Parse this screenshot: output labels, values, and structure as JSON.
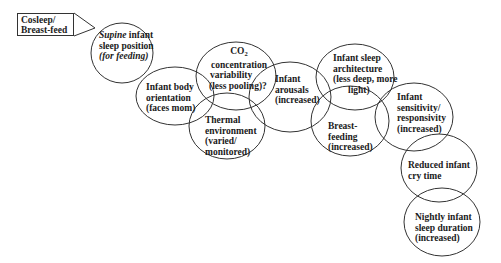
{
  "diagram": {
    "callout": {
      "line1": "Cosleep/",
      "line2": "Breast-feed"
    },
    "nodes": [
      {
        "id": "supine",
        "line1_italic": "Supine",
        "line1_rest": " infant",
        "line2": "sleep position",
        "line3_italic": "(for feeding)"
      },
      {
        "id": "body-orientation",
        "line1": "Infant body",
        "line2": "orientation",
        "line3": "(faces mom)"
      },
      {
        "id": "co2",
        "line1_main": "CO",
        "line1_sub": "2",
        "line2": "concentration",
        "line3": "variability",
        "line4": "(less pooling)?"
      },
      {
        "id": "thermal",
        "line1": "Thermal",
        "line2": "environment",
        "line3": "(varied/",
        "line4": "monitored)"
      },
      {
        "id": "arousals",
        "line1": "Infant",
        "line2": "arousals",
        "line3": "(increased)"
      },
      {
        "id": "sleep-architecture",
        "line1": "Infant sleep",
        "line2": "architecture",
        "line3": "(less deep, more",
        "line4": "light)"
      },
      {
        "id": "breast-feeding",
        "line1": "Breast-",
        "line2": "feeding",
        "line3": "(increased)"
      },
      {
        "id": "sensitivity",
        "line1": "Infant",
        "line2": "sensitivity/",
        "line3": "responsivity",
        "line4": "(increased)"
      },
      {
        "id": "cry-time",
        "line1": "Reduced infant",
        "line2": "cry time"
      },
      {
        "id": "sleep-duration",
        "line1": "Nightly infant",
        "line2": "sleep duration",
        "line3": "(increased)"
      }
    ],
    "colors": {
      "stroke": "#333333",
      "text": "#1a1a1a",
      "background": "#ffffff"
    }
  }
}
